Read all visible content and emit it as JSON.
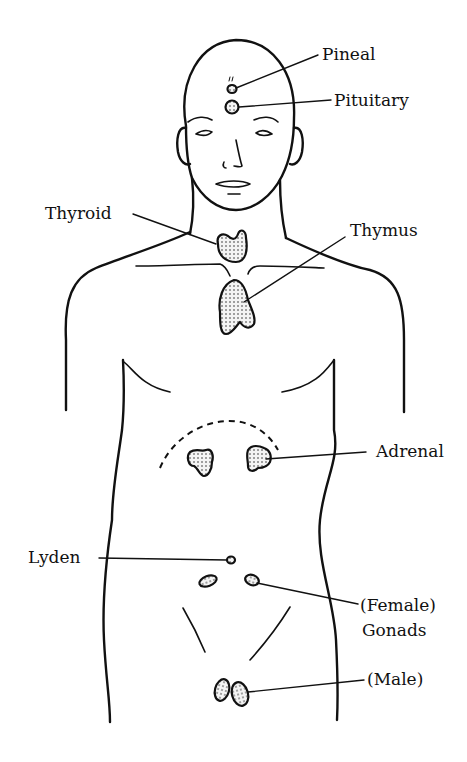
{
  "diagram": {
    "type": "anatomical line drawing",
    "colors": {
      "ink": "#111111",
      "background": "#ffffff"
    },
    "labels": [
      {
        "id": "pineal",
        "text": "Pineal"
      },
      {
        "id": "pituitary",
        "text": "Pituitary"
      },
      {
        "id": "thyroid",
        "text": "Thyroid"
      },
      {
        "id": "thymus",
        "text": "Thymus"
      },
      {
        "id": "adrenal",
        "text": "Adrenal"
      },
      {
        "id": "lyden",
        "text": "Lyden"
      },
      {
        "id": "female_gonads_line1",
        "text": "(Female)"
      },
      {
        "id": "gonads_line2",
        "text": "Gonads"
      },
      {
        "id": "male_gonads",
        "text": "(Male)"
      }
    ]
  }
}
